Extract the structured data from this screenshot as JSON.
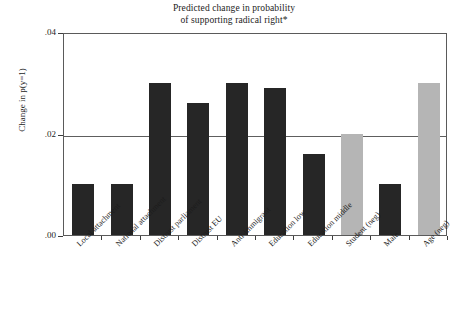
{
  "chart_data": {
    "type": "bar",
    "title": "Predicted change in probability of supporting radical right*",
    "title_lines": [
      "Predicted change in probability",
      "of supporting radical right*"
    ],
    "xlabel": "",
    "ylabel": "Change in p(y=1)",
    "ylim": [
      0.0,
      0.04
    ],
    "yticks": [
      0.0,
      0.02,
      0.04
    ],
    "ytick_labels": [
      ".00",
      ".02",
      ".04"
    ],
    "grid": "horizontal line at .02 only",
    "legend": "none",
    "categories": [
      "Local attachment",
      "National attachment",
      "Distrust parliament",
      "Distrust EU",
      "Anti-immigrant",
      "Education low",
      "Education middle",
      "Student (neg)",
      "Male",
      "Age (neg)"
    ],
    "values": [
      0.01,
      0.01,
      0.03,
      0.026,
      0.03,
      0.029,
      0.016,
      0.02,
      0.01,
      0.03
    ],
    "bar_colors": [
      "#262626",
      "#262626",
      "#262626",
      "#262626",
      "#262626",
      "#262626",
      "#262626",
      "#b5b5b5",
      "#262626",
      "#b5b5b5"
    ],
    "colors": {
      "dark_bar": "#262626",
      "light_bar": "#b5b5b5",
      "axis": "#5a5a5a",
      "gridline": "#5e5e5e",
      "background": "#ffffff",
      "text": "#1c1c1c"
    }
  }
}
